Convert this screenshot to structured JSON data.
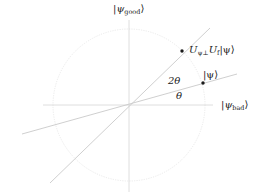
{
  "diagram": {
    "type": "geometric-vector-diagram",
    "colors": {
      "axes": "#d4d4d4",
      "circle": "#e2e2e2",
      "lines": "#c9c9c9",
      "points": "#1a1a1a",
      "text": "#222222"
    },
    "origin": {
      "x": 129,
      "y": 105
    },
    "circle_radius": 76,
    "axes": {
      "horizontal": {
        "label_ket": "ψ",
        "label_sub": "bad",
        "x1": 43,
        "x2": 213
      },
      "vertical": {
        "label_ket": "ψ",
        "label_sub": "good",
        "y1": 20,
        "y2": 192
      }
    },
    "lines": [
      {
        "name": "psi-line",
        "x1": 22,
        "y1": 134,
        "x2": 237,
        "y2": 74
      },
      {
        "name": "rotated-line",
        "x1": 50,
        "y1": 183,
        "x2": 210,
        "y2": 28
      }
    ],
    "points": [
      {
        "name": "psi-point",
        "x": 203,
        "y": 83,
        "label": "|ψ⟩"
      },
      {
        "name": "rotated-point",
        "x": 182,
        "y": 51,
        "label_main": "U",
        "label_sub1": "ψ⊥",
        "label_mid": "U",
        "label_sub2": "f",
        "label_ket": "|ψ⟩"
      }
    ],
    "angle_labels": [
      {
        "name": "theta-label",
        "text": "θ",
        "x": 175,
        "y": 93
      },
      {
        "name": "two-theta-label",
        "text": "2θ",
        "x": 167,
        "y": 77
      }
    ]
  }
}
